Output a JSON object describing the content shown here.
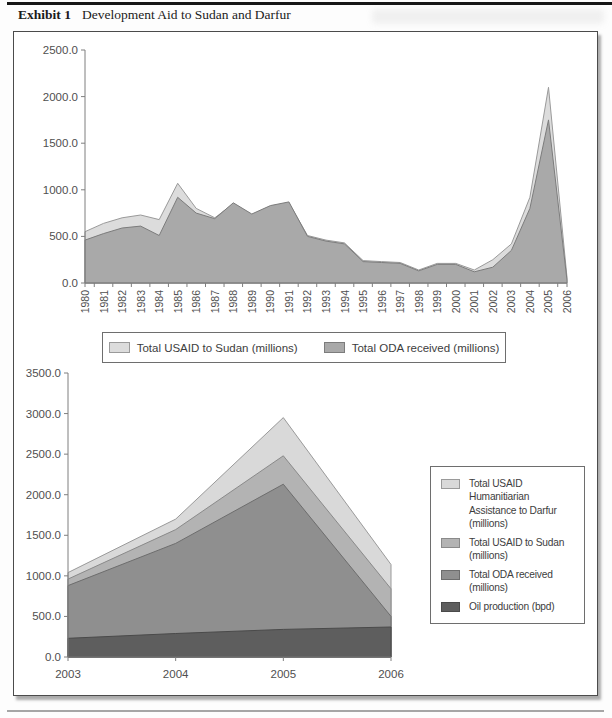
{
  "header": {
    "exhibit_label": "Exhibit 1",
    "title": "Development Aid to Sudan and Darfur"
  },
  "chart_data": [
    {
      "type": "area",
      "name": "Development aid to Sudan 1980-2006",
      "x": [
        "1980",
        "1981",
        "1982",
        "1983",
        "1984",
        "1985",
        "1986",
        "1987",
        "1988",
        "1989",
        "1990",
        "1991",
        "1992",
        "1993",
        "1994",
        "1995",
        "1996",
        "1997",
        "1998",
        "1999",
        "2000",
        "2001",
        "2002",
        "2003",
        "2004",
        "2005",
        "2006"
      ],
      "ylim": [
        0,
        2500
      ],
      "ytick_step": 500,
      "grid": false,
      "legend_position": "bottom",
      "x_label_rotation": -90,
      "series": [
        {
          "name": "Total USAID to Sudan (millions)",
          "color": "#dcdcdc",
          "edge_color": "#9a9a9a",
          "values": [
            550,
            640,
            700,
            730,
            680,
            1070,
            800,
            700,
            850,
            730,
            820,
            860,
            510,
            460,
            430,
            240,
            230,
            220,
            140,
            210,
            210,
            140,
            250,
            420,
            920,
            2100,
            60
          ]
        },
        {
          "name": "Total ODA received (millions)",
          "color": "#a9a9a9",
          "edge_color": "#7c7c7c",
          "values": [
            460,
            530,
            590,
            610,
            510,
            920,
            750,
            690,
            860,
            740,
            830,
            870,
            500,
            450,
            420,
            230,
            220,
            210,
            130,
            200,
            200,
            120,
            170,
            350,
            800,
            1750,
            30
          ]
        }
      ]
    },
    {
      "type": "area",
      "name": "Aid to Sudan and Darfur 2003-2006",
      "x": [
        "2003",
        "2004",
        "2005",
        "2006"
      ],
      "ylim": [
        0,
        3500
      ],
      "ytick_step": 500,
      "grid": false,
      "legend_position": "right",
      "x_label_rotation": 0,
      "series": [
        {
          "name": "Total USAID Humanitiarian Assistance to Darfur (millions)",
          "color": "#d9d9d9",
          "edge_color": "#9a9a9a",
          "values": [
            1040,
            1700,
            2950,
            1140
          ]
        },
        {
          "name": "Total USAID to Sudan (millions)",
          "color": "#b3b3b3",
          "edge_color": "#8a8a8a",
          "values": [
            960,
            1570,
            2480,
            840
          ]
        },
        {
          "name": "Total ODA received (millions)",
          "color": "#8f8f8f",
          "edge_color": "#6d6d6d",
          "values": [
            880,
            1400,
            2130,
            500
          ]
        },
        {
          "name": "Oil production (bpd)",
          "color": "#5e5e5e",
          "edge_color": "#4a4a4a",
          "values": [
            230,
            290,
            340,
            370
          ]
        }
      ]
    }
  ]
}
